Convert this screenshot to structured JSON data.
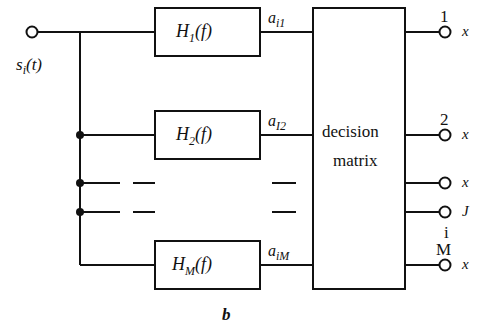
{
  "figure": {
    "caption": "b",
    "input_signal": "s",
    "input_signal_sub": "i",
    "input_signal_arg": "(t)",
    "filters": [
      {
        "name": "H",
        "sub": "1",
        "arg": "(f)"
      },
      {
        "name": "H",
        "sub": "2",
        "arg": "(f)"
      },
      {
        "name": "H",
        "sub": "M",
        "arg": "(f)"
      }
    ],
    "arm_labels": [
      {
        "base": "a",
        "sub": "i1"
      },
      {
        "base": "a",
        "sub": "I2"
      },
      {
        "base": "a",
        "sub": "iM"
      }
    ],
    "decision_block": {
      "line1": "decision",
      "line2": "matrix"
    },
    "outputs": [
      {
        "label": "1",
        "terminal": "x"
      },
      {
        "label": "2",
        "terminal": "x"
      },
      {
        "label": "",
        "terminal": "x"
      },
      {
        "label": "i",
        "terminal": "J"
      },
      {
        "label": "M",
        "terminal": "x"
      }
    ],
    "ellipsis_mark": "–",
    "colors": {
      "line": "#111111",
      "background": "#ffffff"
    }
  }
}
